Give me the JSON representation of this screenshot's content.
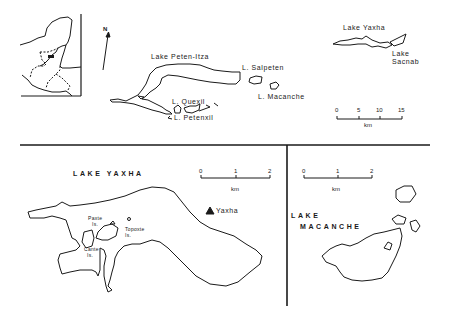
{
  "overview": {
    "north_label": "N",
    "lakes": {
      "peten_itza": "Lake Peten-Itza",
      "salpeten": "L. Salpeten",
      "macanche": "L. Macanche",
      "quexil": "L. Quexil",
      "petenxil": "L. Petenxil",
      "yaxha": "Lake Yaxha",
      "sacnab_line1": "Lake",
      "sacnab_line2": "Sacnab"
    },
    "scale": {
      "ticks": [
        "0",
        "5",
        "10",
        "15"
      ],
      "unit": "km"
    }
  },
  "yaxha_panel": {
    "title": "LAKE YAXHA",
    "site_label": "Yaxha",
    "islands": {
      "paxte_line1": "Paxte",
      "paxte_line2": "Is.",
      "topoxte_line1": "Topoxte",
      "topoxte_line2": "Is.",
      "cante_line1": "Cante",
      "cante_line2": "Is."
    },
    "scale": {
      "ticks": [
        "0",
        "1",
        "2"
      ],
      "unit": "km"
    }
  },
  "macanche_panel": {
    "title_line1": "LAKE",
    "title_line2": "MACANCHE",
    "scale": {
      "ticks": [
        "0",
        "1",
        "2"
      ],
      "unit": "km"
    }
  }
}
